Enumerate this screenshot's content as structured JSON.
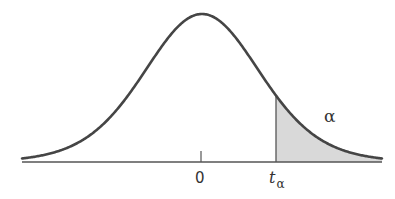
{
  "diagram": {
    "title": "",
    "type": "t-distribution upper tail area",
    "labels": {
      "center": "0",
      "critical_value_main": "t",
      "critical_value_sub": "α",
      "tail_area": "α"
    },
    "colors": {
      "curve": "#454545",
      "baseline": "#555555",
      "shade": "#d9d9d9",
      "background": "#ffffff"
    },
    "geometry": {
      "x_start": 22,
      "x_end": 382,
      "center_x": 202,
      "baseline_y": 162,
      "peak_y": 14,
      "sigma_px": 59,
      "t_alpha_x": 276,
      "tail_dof": 12
    }
  }
}
